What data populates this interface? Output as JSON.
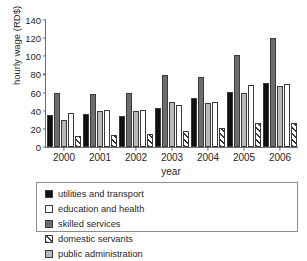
{
  "figure": {
    "clipped_title_fragment": "",
    "xlabel": "year",
    "ylabel": "hourly wage (RD$)"
  },
  "legend": {
    "items": [
      {
        "label": "utilities and transport",
        "swatch": "solid-black-swatch"
      },
      {
        "label": "education and health",
        "swatch": "white-swatch"
      },
      {
        "label": "skilled services",
        "swatch": "dark-gray-swatch"
      },
      {
        "label": "domestic servants",
        "swatch": "diagonal-hatch-swatch"
      },
      {
        "label": "public administration",
        "swatch": "light-gray-swatch"
      }
    ]
  },
  "yaxis": {
    "ticks": [
      "0",
      "20",
      "40",
      "60",
      "80",
      "100",
      "120",
      "140"
    ]
  },
  "chart_data": {
    "type": "bar",
    "title": "",
    "xlabel": "year",
    "ylabel": "hourly wage (RD$)",
    "ylim": [
      0,
      140
    ],
    "ytick_step": 20,
    "grid": false,
    "legend_position": "bottom",
    "categories": [
      "2000",
      "2001",
      "2002",
      "2003",
      "2004",
      "2005",
      "2006"
    ],
    "series": [
      {
        "name": "utilities and transport",
        "color": "#111111",
        "values": [
          35,
          36,
          34,
          43,
          54,
          61,
          71
        ]
      },
      {
        "name": "skilled services",
        "color": "#6d6d6d",
        "values": [
          60,
          58,
          60,
          79,
          77,
          101,
          120
        ]
      },
      {
        "name": "public administration",
        "color": "#b9b9b9",
        "values": [
          30,
          40,
          40,
          50,
          49,
          59,
          67
        ]
      },
      {
        "name": "education and health",
        "color": "#ffffff",
        "values": [
          38,
          40.5,
          41,
          46,
          50,
          68,
          70
        ]
      },
      {
        "name": "domestic servants",
        "color": "hatched",
        "values": [
          12,
          13,
          14,
          18,
          21,
          27,
          27
        ]
      }
    ]
  }
}
